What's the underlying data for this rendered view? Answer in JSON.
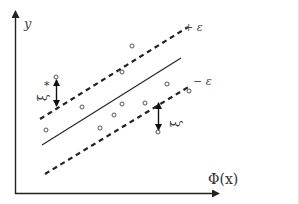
{
  "diagram": {
    "y_axis_label": "y",
    "x_axis_label": "Φ(x)",
    "upper_margin_label": "+ ε",
    "lower_margin_label": "− ε",
    "slack_upper_label": "ξ",
    "slack_upper_superscript": "*",
    "slack_lower_label": "ξ",
    "colors": {
      "line": "#222222",
      "point": "#555555",
      "background": "#ffffff"
    },
    "regression_line": {
      "x1": 42,
      "y1": 145,
      "x2": 181,
      "y2": 58
    },
    "upper_tube": {
      "x1": 40,
      "y1": 119,
      "x2": 188,
      "y2": 27
    },
    "lower_tube": {
      "x1": 45,
      "y1": 174,
      "x2": 190,
      "y2": 86
    },
    "points": [
      {
        "x": 132,
        "y": 46
      },
      {
        "x": 122,
        "y": 72
      },
      {
        "x": 56,
        "y": 77
      },
      {
        "x": 82,
        "y": 107
      },
      {
        "x": 122,
        "y": 104
      },
      {
        "x": 145,
        "y": 103
      },
      {
        "x": 114,
        "y": 115
      },
      {
        "x": 100,
        "y": 128
      },
      {
        "x": 46,
        "y": 130
      },
      {
        "x": 167,
        "y": 84
      },
      {
        "x": 189,
        "y": 91
      },
      {
        "x": 158,
        "y": 132
      }
    ]
  }
}
